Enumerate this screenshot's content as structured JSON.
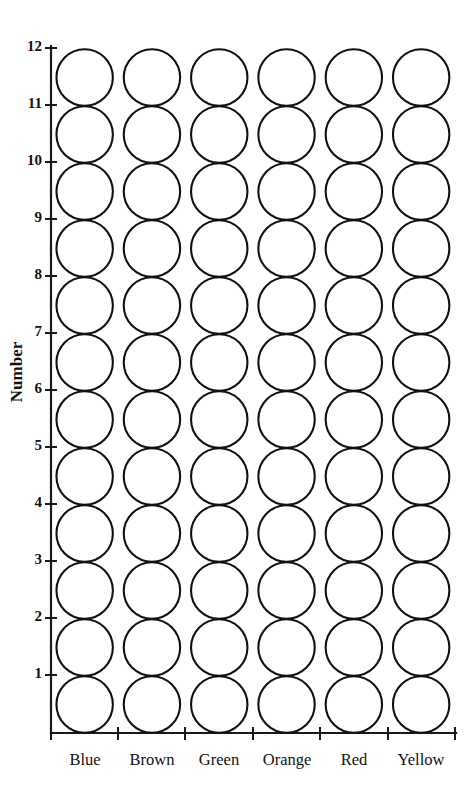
{
  "chart_data": {
    "type": "bar",
    "subtype": "unit-dot-plot",
    "title": "",
    "subtitle": "",
    "xlabel": "",
    "ylabel": "Number",
    "categories": [
      "Blue",
      "Brown",
      "Green",
      "Orange",
      "Red",
      "Yellow"
    ],
    "values": [
      12,
      12,
      12,
      12,
      12,
      12
    ],
    "series": [
      {
        "name": "Count",
        "values": [
          12,
          12,
          12,
          12,
          12,
          12
        ]
      }
    ],
    "ylim": [
      0,
      12
    ],
    "xlim": [
      0,
      6
    ],
    "y_ticks": [
      1,
      2,
      3,
      4,
      5,
      6,
      7,
      8,
      9,
      10,
      11,
      12
    ],
    "y_tick_labels": [
      "1",
      "2",
      "3",
      "4",
      "5",
      "6",
      "7",
      "8",
      "9",
      "10",
      "11",
      "12"
    ],
    "x_tick_labels": [
      "Blue",
      "Brown",
      "Green",
      "Orange",
      "Red",
      "Yellow"
    ],
    "grid": false,
    "legend": false,
    "legend_position": "none",
    "marker": "open-circle",
    "marker_fill": "#ffffff",
    "marker_stroke": "#111111",
    "background": "#ffffff",
    "axis_color": "#1a1a1a",
    "annotations": []
  },
  "axes": {
    "y_title": "Number",
    "y_tick_labels": [
      "12",
      "11",
      "10",
      "9",
      "8",
      "7",
      "6",
      "5",
      "4",
      "3",
      "2",
      "1"
    ],
    "x_tick_labels": [
      "Blue",
      "Brown",
      "Green",
      "Orange",
      "Red",
      "Yellow"
    ]
  },
  "colors": {
    "stroke": "#111111",
    "axis": "#1a1a1a",
    "marker_fill": "#ffffff",
    "background": "#ffffff"
  }
}
